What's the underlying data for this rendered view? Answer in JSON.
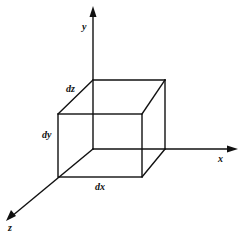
{
  "diagram": {
    "type": "3d-differential-volume-element",
    "colors": {
      "stroke": "#111111",
      "background": "#ffffff"
    },
    "axes": {
      "x": {
        "label": "x"
      },
      "y": {
        "label": "y"
      },
      "z": {
        "label": "z"
      }
    },
    "edges": {
      "dx": "dx",
      "dy": "dy",
      "dz": "dz"
    }
  }
}
